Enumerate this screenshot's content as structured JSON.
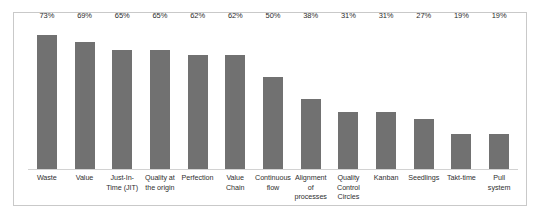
{
  "chart_data": {
    "type": "bar",
    "title": "",
    "subtitle": "",
    "xlabel": "",
    "ylabel": "",
    "grid": false,
    "legend": false,
    "orientation": "vertical",
    "value_suffix": "%",
    "ylim": [
      0,
      80
    ],
    "categories": [
      "Waste",
      "Value",
      "Just-In-Time (JIT)",
      "Quality at the origin",
      "Perfection",
      "Value Chain",
      "Continuous flow",
      "Alignment of processes",
      "Quality Control Circles",
      "Kanban",
      "Seedlings",
      "Takt-time",
      "Pull system"
    ],
    "values": [
      73,
      69,
      65,
      65,
      62,
      62,
      50,
      38,
      31,
      31,
      27,
      19,
      19
    ],
    "value_labels": [
      "73%",
      "69%",
      "65%",
      "65%",
      "62%",
      "62%",
      "50%",
      "38%",
      "31%",
      "31%",
      "27%",
      "19%",
      "19%"
    ],
    "bar_color": "#717171",
    "axis_color": "#d2d2d2",
    "frame_color": "#c9c9c9",
    "background_color": "#ffffff",
    "label_color": "#2f2f2f"
  }
}
